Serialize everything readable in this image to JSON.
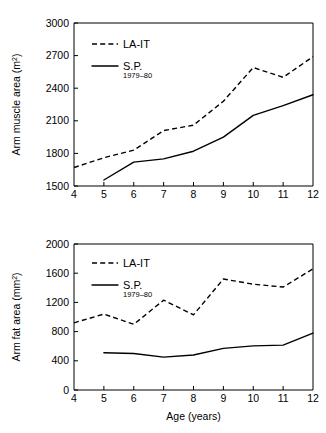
{
  "figures": [
    {
      "id": "arm-muscle-area",
      "ylabel": "Arm muscle area (m",
      "ylabel_sup": "2",
      "ylabel_close": ")",
      "xlabel": "",
      "yticks": [
        "1500",
        "1800",
        "2100",
        "2400",
        "2700",
        "3000"
      ],
      "xticks": [
        "4",
        "5",
        "6",
        "7",
        "8",
        "9",
        "10",
        "11",
        "12"
      ],
      "legend": [
        {
          "label": "LA-IT",
          "sub": "",
          "style": "dashed"
        },
        {
          "label": "S.P.",
          "sub": "1979–80",
          "style": "solid"
        }
      ]
    },
    {
      "id": "arm-fat-area",
      "ylabel": "Arm fat area (mm",
      "ylabel_sup": "2",
      "ylabel_close": ")",
      "xlabel": "Age (years)",
      "yticks": [
        "0",
        "400",
        "800",
        "1200",
        "1600",
        "2000"
      ],
      "xticks": [
        "4",
        "5",
        "6",
        "7",
        "8",
        "9",
        "10",
        "11",
        "12"
      ],
      "legend": [
        {
          "label": "LA-IT",
          "sub": "",
          "style": "dashed"
        },
        {
          "label": "S.P.",
          "sub": "1979–80",
          "style": "solid"
        }
      ]
    }
  ],
  "chart_data": [
    {
      "type": "line",
      "title": "",
      "xlabel": "",
      "ylabel": "Arm muscle area (m2)",
      "xlim": [
        4,
        12
      ],
      "ylim": [
        1500,
        3000
      ],
      "yticks": [
        1500,
        1800,
        2100,
        2400,
        2700,
        3000
      ],
      "xticks": [
        4,
        5,
        6,
        7,
        8,
        9,
        10,
        11,
        12
      ],
      "grid": false,
      "legend_position": "top-left",
      "series": [
        {
          "name": "LA-IT",
          "style": "dashed",
          "x": [
            4,
            5,
            6,
            7,
            8,
            9,
            10,
            11,
            12
          ],
          "values": [
            1670,
            1760,
            1830,
            2010,
            2060,
            2280,
            2590,
            2500,
            2690
          ]
        },
        {
          "name": "S.P. 1979-80",
          "style": "solid",
          "x": [
            5,
            6,
            7,
            8,
            9,
            10,
            11,
            12
          ],
          "values": [
            1555,
            1720,
            1750,
            1820,
            1950,
            2150,
            2240,
            2340
          ]
        }
      ]
    },
    {
      "type": "line",
      "title": "",
      "xlabel": "Age (years)",
      "ylabel": "Arm fat area (mm2)",
      "xlim": [
        4,
        12
      ],
      "ylim": [
        0,
        2000
      ],
      "yticks": [
        0,
        400,
        800,
        1200,
        1600,
        2000
      ],
      "xticks": [
        4,
        5,
        6,
        7,
        8,
        9,
        10,
        11,
        12
      ],
      "grid": false,
      "legend_position": "top-left",
      "series": [
        {
          "name": "LA-IT",
          "style": "dashed",
          "x": [
            4,
            5,
            6,
            7,
            8,
            9,
            10,
            11,
            12
          ],
          "values": [
            920,
            1040,
            900,
            1230,
            1030,
            1520,
            1450,
            1410,
            1660
          ]
        },
        {
          "name": "S.P. 1979-80",
          "style": "solid",
          "x": [
            5,
            6,
            7,
            8,
            9,
            10,
            11,
            12
          ],
          "values": [
            510,
            500,
            450,
            480,
            570,
            605,
            615,
            780
          ]
        }
      ]
    }
  ]
}
